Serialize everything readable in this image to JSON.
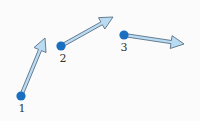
{
  "diagram": {
    "type": "vector-points",
    "colors": {
      "point": "#1b6fc0",
      "arrow_fill": "#b9dcf2",
      "arrow_stroke": "#5a6f86",
      "label": "#333333",
      "background": "#fbfbfb"
    },
    "points": [
      {
        "id": 1,
        "label": "1",
        "position": [
          21,
          96
        ],
        "label_position": [
          22,
          103
        ],
        "arrow": {
          "tip": [
            45,
            38
          ]
        }
      },
      {
        "id": 2,
        "label": "2",
        "position": [
          61,
          46
        ],
        "label_position": [
          63,
          53
        ],
        "arrow": {
          "tip": [
            113,
            17
          ]
        }
      },
      {
        "id": 3,
        "label": "3",
        "position": [
          124,
          35
        ],
        "label_position": [
          124,
          42
        ],
        "arrow": {
          "tip": [
            184,
            44
          ]
        }
      }
    ]
  }
}
